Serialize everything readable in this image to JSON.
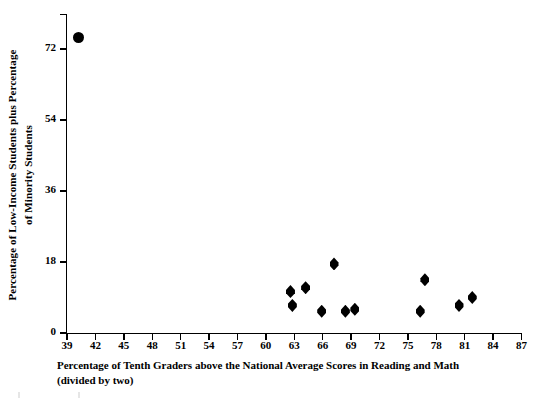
{
  "chart_data": {
    "type": "scatter",
    "title": "",
    "xlabel": "Percentage of Tenth Graders above the National Average Scores in Reading and Math (divided by two)",
    "xlabel_line1": "Percentage of Tenth Graders above the National Average Scores in Reading and Math",
    "xlabel_line2": "(divided by two)",
    "ylabel": "Percentage of Low-Income Students plus Percentage of Minority Students",
    "ylabel_line1": "Percentage of Low-Income Students plus Percentage",
    "ylabel_line2": "of Minority Students",
    "xlim": [
      39,
      87
    ],
    "ylim": [
      0,
      79
    ],
    "xticks": [
      39,
      42,
      45,
      48,
      51,
      54,
      57,
      60,
      63,
      66,
      69,
      72,
      75,
      78,
      81,
      84,
      87
    ],
    "yticks": [
      0,
      18,
      36,
      54,
      72
    ],
    "grid": false,
    "legend": false,
    "marker_color": "#000000",
    "series": [
      {
        "name": "outlier",
        "marker": "circle",
        "points": [
          {
            "x": 40.2,
            "y": 75.0
          }
        ]
      },
      {
        "name": "schools",
        "marker": "diamond",
        "points": [
          {
            "x": 62.6,
            "y": 10.5
          },
          {
            "x": 62.8,
            "y": 7.0
          },
          {
            "x": 64.2,
            "y": 11.5
          },
          {
            "x": 65.9,
            "y": 5.5
          },
          {
            "x": 67.2,
            "y": 17.5
          },
          {
            "x": 68.4,
            "y": 5.5
          },
          {
            "x": 69.4,
            "y": 6.0
          },
          {
            "x": 76.3,
            "y": 5.5
          },
          {
            "x": 76.8,
            "y": 13.5
          },
          {
            "x": 80.4,
            "y": 7.0
          },
          {
            "x": 81.8,
            "y": 9.0
          }
        ]
      }
    ]
  }
}
